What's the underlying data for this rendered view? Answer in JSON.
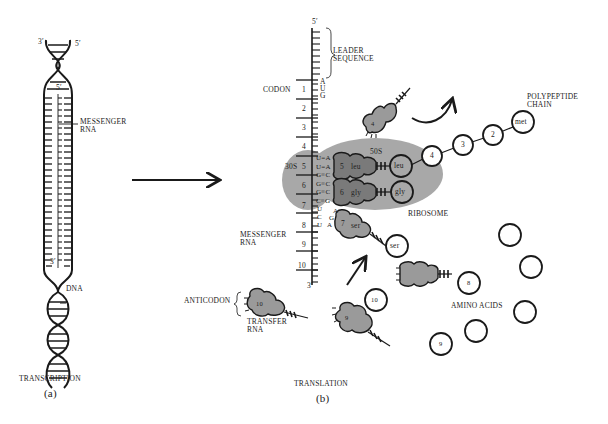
{
  "figure": {
    "panel_a": {
      "caption": "TRANSCRIPTION",
      "label": "(a)",
      "labels": {
        "dna_end_3": "3′",
        "dna_end_5": "5′",
        "mrna_end_5": "5′",
        "mrna_end_3": "3′",
        "messenger_rna_1": "MESSENGER",
        "messenger_rna_2": "RNA",
        "dna": "DNA"
      }
    },
    "panel_b": {
      "caption": "TRANSLATION",
      "label": "(b)",
      "labels": {
        "mrna_top": "5′",
        "mrna_bottom": "3′",
        "leader_1": "LEADER",
        "leader_2": "SEQUENCE",
        "codon": "CODON",
        "start_codon": [
          "A",
          "U",
          "G"
        ],
        "subunit_30s": "30S",
        "subunit_50s": "50S",
        "ribosome": "RIBOSOME",
        "polypeptide_1": "POLYPEPTIDE",
        "polypeptide_2": "CHAIN",
        "messenger_rna_1": "MESSENGER",
        "messenger_rna_2": "RNA",
        "anticodon": "ANTICODON",
        "transfer_rna_1": "TRANSFER",
        "transfer_rna_2": "RNA",
        "amino_acids": "AMINO ACIDS"
      },
      "codon_numbers": [
        "1",
        "2",
        "3",
        "4",
        "5",
        "6",
        "7",
        "8",
        "9",
        "10"
      ],
      "base_pairs": [
        "U=A",
        "U=A",
        "G≡C",
        "G≡C",
        "G≡C",
        "C≡G"
      ],
      "free_bases_mrna": [
        "U",
        "C",
        "U"
      ],
      "free_bases_trna": [
        "A",
        "G",
        "A"
      ],
      "trnas": [
        {
          "number": "4",
          "aa": ""
        },
        {
          "number": "5",
          "aa": "leu"
        },
        {
          "number": "6",
          "aa": "gly"
        },
        {
          "number": "7",
          "aa": "ser"
        },
        {
          "number": "",
          "aa": ""
        },
        {
          "number": "9",
          "aa": ""
        },
        {
          "number": "10",
          "aa": ""
        }
      ],
      "chain_residues": [
        "met",
        "2",
        "3",
        "4",
        "leu",
        "gly"
      ],
      "bound_amino_acid_ser": "ser",
      "free_amino_acids": [
        "8",
        "9",
        "10",
        "",
        "",
        "",
        ""
      ]
    }
  },
  "colors": {
    "ink": "#1a1a1a",
    "ribosome": "#a8a8a8",
    "trna_bound": "#7a7a7a",
    "trna_free": "#9a9a9a"
  }
}
